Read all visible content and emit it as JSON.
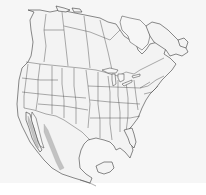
{
  "map": {
    "region": "North America",
    "type": "outline range map",
    "colors": {
      "background": "#f6f6f6",
      "land_fill": "#f3f3f3",
      "outline": "#3a3a3a",
      "range_fill": "#bdbdbd"
    },
    "shaded_range": {
      "description": "Shaded range along the Pacific slope of western Mexico and the Gulf of California coast"
    }
  }
}
